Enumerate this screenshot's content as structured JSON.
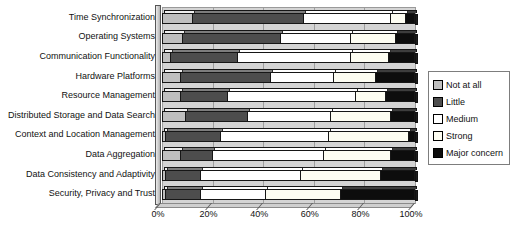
{
  "chart_data": {
    "type": "bar",
    "orientation": "horizontal",
    "stacked": true,
    "stacked_total": 100,
    "title": "",
    "xlabel": "",
    "ylabel": "",
    "xlim": [
      0,
      100
    ],
    "x_ticks": [
      "0%",
      "20%",
      "40%",
      "60%",
      "80%",
      "100%"
    ],
    "grid": true,
    "legend_position": "right",
    "plot_bg_color": "#d4d4d4",
    "gridline_color": "#9e9e9e",
    "categories": [
      "Time Synchronization",
      "Operating Systems",
      "Communication Functionality",
      "Hardware Platforms",
      "Resource Management",
      "Distributed Storage and Data Search",
      "Context and Location Management",
      "Data Aggregation",
      "Data Consistency and Adaptivity",
      "Security, Privacy and Trust"
    ],
    "series": [
      {
        "name": "Not at all",
        "color": "#bfbfbf",
        "values": [
          12,
          8,
          3,
          7,
          7,
          9,
          1,
          7,
          1,
          1
        ]
      },
      {
        "name": "Little",
        "color": "#4d4d4d",
        "values": [
          44,
          39,
          27,
          36,
          19,
          25,
          22,
          13,
          14,
          14
        ]
      },
      {
        "name": "Medium",
        "color": "#ffffff",
        "values": [
          35,
          28,
          45,
          25,
          51,
          33,
          43,
          44,
          40,
          26
        ]
      },
      {
        "name": "Strong",
        "color": "#fdfdf2",
        "values": [
          6,
          18,
          15,
          17,
          12,
          24,
          32,
          27,
          32,
          30
        ]
      },
      {
        "name": "Major concern",
        "color": "#0d0d0d",
        "values": [
          3,
          7,
          10,
          15,
          11,
          9,
          2,
          9,
          13,
          29
        ]
      }
    ]
  }
}
